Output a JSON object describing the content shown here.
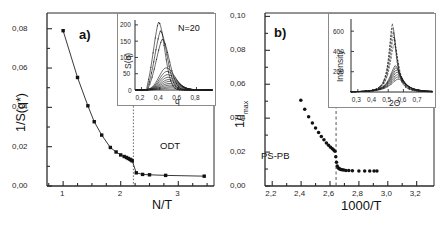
{
  "figure": {
    "background": "#ffffff",
    "ink": "#1a1a1a",
    "panels": [
      "a)",
      "b)"
    ]
  },
  "panel_a": {
    "tag": "a)",
    "annotation_odt": "ODT",
    "axis": {
      "xlabel": "N/T",
      "ylabel": "1/S(q*)",
      "xticks": [
        "1",
        "2",
        "3"
      ],
      "yticks": [
        "0,00",
        "0,02",
        "0,04",
        "0,06",
        "0,08"
      ]
    },
    "inset": {
      "label": "N=20",
      "xlabel": "q",
      "ylabel": "S(q)",
      "xticks": [
        "0,2",
        "0,4",
        "0,6",
        "0,8"
      ],
      "yticks": [
        "0",
        "50",
        "100",
        "150",
        "200"
      ]
    }
  },
  "panel_b": {
    "tag": "b)",
    "annotation_sample": "PS-PB",
    "axis": {
      "xlabel": "1000/T",
      "ylabel_main": "1/I",
      "ylabel_sub": "max",
      "xticks": [
        "2,2",
        "2,4",
        "2,6",
        "2,8",
        "3,0",
        "3,2"
      ],
      "yticks": [
        "0,00",
        "0,02",
        "0,04",
        "0,06",
        "0,08",
        "0,10"
      ]
    },
    "inset": {
      "xlabel": "2Θ",
      "ylabel": "Intensity",
      "xticks": [
        "0,3",
        "0,4",
        "0,5",
        "0,6",
        "0,7"
      ],
      "yticks": [
        "200",
        "400",
        "600"
      ]
    }
  },
  "chart_data": [
    {
      "type": "scatter",
      "name": "panel-a-main",
      "title": "a)",
      "xlabel": "N/T",
      "ylabel": "1/S(q*)",
      "xlim": [
        0.72,
        3.62
      ],
      "ylim": [
        0.0,
        0.088
      ],
      "xticks": [
        1,
        2,
        3
      ],
      "yticks": [
        0.0,
        0.02,
        0.04,
        0.06,
        0.08
      ],
      "marker": "square",
      "line": true,
      "grid": false,
      "annotations": [
        {
          "text": "ODT",
          "x": 2.32,
          "y": 0.0175,
          "line": "dotted-vertical",
          "line_x": 2.22
        }
      ],
      "x": [
        1.0,
        1.25,
        1.43,
        1.54,
        1.67,
        1.82,
        1.92,
        2.0,
        2.06,
        2.1,
        2.13,
        2.16,
        2.18,
        2.2,
        2.27,
        2.38,
        2.5,
        2.78,
        3.45
      ],
      "y": [
        0.079,
        0.0552,
        0.0408,
        0.0327,
        0.0259,
        0.0196,
        0.0173,
        0.0158,
        0.015,
        0.0145,
        0.014,
        0.0136,
        0.0132,
        0.0128,
        0.0067,
        0.0059,
        0.0057,
        0.0054,
        0.005
      ]
    },
    {
      "type": "line",
      "name": "panel-a-inset",
      "title": "N=20",
      "xlabel": "q",
      "ylabel": "S(q)",
      "xlim": [
        0.13,
        0.98
      ],
      "ylim": [
        0,
        215
      ],
      "xticks": [
        0.2,
        0.4,
        0.6,
        0.8
      ],
      "yticks": [
        0,
        50,
        100,
        150,
        200
      ],
      "grid": false,
      "series": [
        {
          "name": "curve-1",
          "peak_q": 0.385,
          "peak_value": 209,
          "width": 0.088,
          "start_q": 0.255
        },
        {
          "name": "curve-2",
          "peak_q": 0.405,
          "peak_value": 181,
          "width": 0.094,
          "start_q": 0.262
        },
        {
          "name": "curve-3",
          "peak_q": 0.425,
          "peak_value": 156,
          "width": 0.1,
          "start_q": 0.268
        },
        {
          "name": "curve-4",
          "peak_q": 0.47,
          "peak_value": 68,
          "width": 0.122,
          "start_q": 0.15
        },
        {
          "name": "curve-5",
          "peak_q": 0.478,
          "peak_value": 57,
          "width": 0.126,
          "start_q": 0.15
        },
        {
          "name": "curve-6",
          "peak_q": 0.484,
          "peak_value": 47,
          "width": 0.13,
          "start_q": 0.15
        },
        {
          "name": "curve-7",
          "peak_q": 0.49,
          "peak_value": 39,
          "width": 0.134,
          "start_q": 0.15
        },
        {
          "name": "curve-8",
          "peak_q": 0.496,
          "peak_value": 32,
          "width": 0.138,
          "start_q": 0.15
        },
        {
          "name": "curve-9",
          "peak_q": 0.502,
          "peak_value": 26,
          "width": 0.142,
          "start_q": 0.15
        },
        {
          "name": "curve-10",
          "peak_q": 0.508,
          "peak_value": 20,
          "width": 0.146,
          "start_q": 0.15
        },
        {
          "name": "curve-11",
          "peak_q": 0.514,
          "peak_value": 15,
          "width": 0.15,
          "start_q": 0.15
        },
        {
          "name": "curve-12",
          "peak_q": 0.52,
          "peak_value": 10,
          "width": 0.154,
          "start_q": 0.15
        },
        {
          "name": "curve-13",
          "peak_q": 0.526,
          "peak_value": 6,
          "width": 0.158,
          "start_q": 0.15
        }
      ]
    },
    {
      "type": "scatter",
      "name": "panel-b-main",
      "title": "b)",
      "xlabel": "1000/T",
      "ylabel": "1/Imax",
      "xlim": [
        2.15,
        3.32
      ],
      "ylim": [
        0.0,
        0.102
      ],
      "xticks": [
        2.2,
        2.4,
        2.6,
        2.8,
        3.0,
        3.2
      ],
      "yticks": [
        0.0,
        0.02,
        0.04,
        0.06,
        0.08,
        0.1
      ],
      "marker": "circle",
      "line": false,
      "grid": false,
      "annotations": [
        {
          "text": "PS-PB",
          "x": 2.34,
          "y": 0.0115,
          "line": "none"
        },
        {
          "text": "",
          "x": 2.64,
          "y": 0.0,
          "line": "dashed-vertical",
          "line_x": 2.642
        }
      ],
      "x": [
        2.398,
        2.425,
        2.452,
        2.478,
        2.5,
        2.521,
        2.54,
        2.558,
        2.575,
        2.59,
        2.604,
        2.616,
        2.626,
        2.634,
        2.64,
        2.645,
        2.65,
        2.656,
        2.662,
        2.668,
        2.675,
        2.684,
        2.695,
        2.71,
        2.73,
        2.755,
        2.8,
        2.84,
        2.875,
        2.905,
        2.925
      ],
      "y": [
        0.0505,
        0.0452,
        0.0408,
        0.0372,
        0.0342,
        0.0315,
        0.0292,
        0.0272,
        0.0254,
        0.024,
        0.0228,
        0.0219,
        0.0212,
        0.0205,
        0.0172,
        0.014,
        0.0118,
        0.0108,
        0.0103,
        0.01,
        0.0098,
        0.0096,
        0.0094,
        0.0092,
        0.0091,
        0.009,
        0.0089,
        0.0089,
        0.0088,
        0.0088,
        0.0088
      ]
    },
    {
      "type": "line",
      "name": "panel-b-inset",
      "xlabel": "2Θ",
      "ylabel": "Intensity",
      "xlim": [
        0.255,
        0.795
      ],
      "ylim": [
        0,
        720
      ],
      "xticks": [
        0.3,
        0.4,
        0.5,
        0.6,
        0.7
      ],
      "yticks": [
        200,
        400,
        600
      ],
      "grid": false,
      "series": [
        {
          "name": "curve-1",
          "peak_2theta": 0.528,
          "peak_value": 680,
          "width": 0.042
        },
        {
          "name": "curve-2",
          "peak_2theta": 0.53,
          "peak_value": 648,
          "width": 0.044
        },
        {
          "name": "curve-3",
          "peak_2theta": 0.533,
          "peak_value": 600,
          "width": 0.046
        },
        {
          "name": "curve-4",
          "peak_2theta": 0.536,
          "peak_value": 545,
          "width": 0.048
        },
        {
          "name": "curve-5",
          "peak_2theta": 0.54,
          "peak_value": 480,
          "width": 0.052
        },
        {
          "name": "curve-6",
          "peak_2theta": 0.548,
          "peak_value": 262,
          "width": 0.068
        },
        {
          "name": "curve-7",
          "peak_2theta": 0.551,
          "peak_value": 240,
          "width": 0.072
        },
        {
          "name": "curve-8",
          "peak_2theta": 0.554,
          "peak_value": 218,
          "width": 0.076
        },
        {
          "name": "curve-9",
          "peak_2theta": 0.557,
          "peak_value": 196,
          "width": 0.08
        },
        {
          "name": "curve-10",
          "peak_2theta": 0.56,
          "peak_value": 172,
          "width": 0.084
        },
        {
          "name": "curve-11",
          "peak_2theta": 0.563,
          "peak_value": 150,
          "width": 0.088
        },
        {
          "name": "curve-12",
          "peak_2theta": 0.566,
          "peak_value": 128,
          "width": 0.092
        }
      ]
    }
  ]
}
